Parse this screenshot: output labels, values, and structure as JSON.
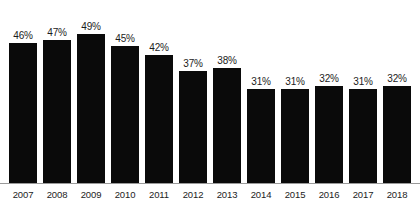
{
  "chart_data": {
    "type": "bar",
    "title": "",
    "subtitle": "",
    "xlabel": "",
    "ylabel": "",
    "categories": [
      "2007",
      "2008",
      "2009",
      "2010",
      "2011",
      "2012",
      "2013",
      "2014",
      "2015",
      "2016",
      "2017",
      "2018"
    ],
    "values": [
      46,
      47,
      49,
      45,
      42,
      37,
      38,
      31,
      31,
      32,
      31,
      32
    ],
    "value_labels": [
      "46%",
      "47%",
      "49%",
      "45%",
      "42%",
      "37%",
      "38%",
      "31%",
      "31%",
      "32%",
      "31%",
      "32%"
    ],
    "ylim": [
      0,
      52
    ],
    "grid": false,
    "legend": null,
    "bar_color": "#0a0a0a",
    "axis_color": "#9a9a9a",
    "label_color": "#1c1c1c",
    "background_color": "#ffffff",
    "annotations": []
  }
}
